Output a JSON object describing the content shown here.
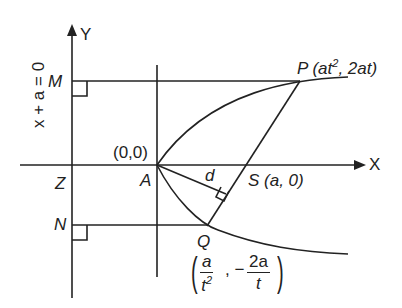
{
  "diagram": {
    "type": "parabola-focal-chord",
    "colors": {
      "ink": "#222222",
      "background": "#ffffff"
    },
    "axes": {
      "y_label": "Y",
      "x_label": "X"
    },
    "directrix_label": "x + a = 0",
    "points": {
      "M": "M",
      "Z": "Z",
      "N": "N",
      "A": "A",
      "origin": "(0,0)",
      "P": "P",
      "P_coords": {
        "open": "(at",
        "sup": "2",
        "close": ", 2at)"
      },
      "S": "S (a, 0)",
      "Q": "Q",
      "Q_coords": {
        "x_num": "a",
        "x_den": "t",
        "x_den_sup": "2",
        "sep": ", −",
        "y_num": "2a",
        "y_den": "t"
      }
    },
    "distance_label": "d",
    "header_fragment": "P(at²,2at)"
  }
}
